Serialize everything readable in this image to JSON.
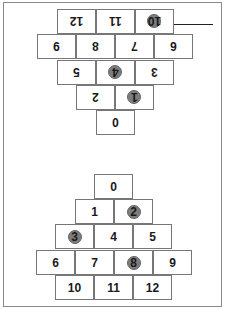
{
  "title": "Cover Up",
  "colors": {
    "counter": "#7d7d7d",
    "border": "#777777",
    "text": "#1a1a1a"
  },
  "boards": [
    {
      "name": "flipped-board",
      "orientation": "rotated-180",
      "cells": [
        {
          "n": "0",
          "covered": false
        },
        {
          "n": "1",
          "covered": true
        },
        {
          "n": "2",
          "covered": false
        },
        {
          "n": "3",
          "covered": false
        },
        {
          "n": "4",
          "covered": true
        },
        {
          "n": "5",
          "covered": false
        },
        {
          "n": "6",
          "covered": false
        },
        {
          "n": "7",
          "covered": false
        },
        {
          "n": "8",
          "covered": false
        },
        {
          "n": "9",
          "covered": false
        },
        {
          "n": "10",
          "covered": true
        },
        {
          "n": "11",
          "covered": false
        },
        {
          "n": "12",
          "covered": false
        }
      ]
    },
    {
      "name": "upright-board",
      "orientation": "upright",
      "cells": [
        {
          "n": "0",
          "covered": false
        },
        {
          "n": "1",
          "covered": false
        },
        {
          "n": "2",
          "covered": true
        },
        {
          "n": "3",
          "covered": true
        },
        {
          "n": "4",
          "covered": false
        },
        {
          "n": "5",
          "covered": false
        },
        {
          "n": "6",
          "covered": false
        },
        {
          "n": "7",
          "covered": false
        },
        {
          "n": "8",
          "covered": true
        },
        {
          "n": "9",
          "covered": false
        },
        {
          "n": "10",
          "covered": false
        },
        {
          "n": "11",
          "covered": false
        },
        {
          "n": "12",
          "covered": false
        }
      ]
    }
  ]
}
